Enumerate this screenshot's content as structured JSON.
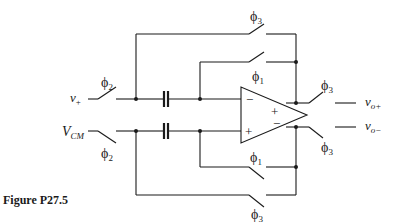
{
  "figure": {
    "caption": "Figure P27.5",
    "type": "switched-capacitor fully differential op-amp circuit"
  },
  "labels": {
    "input_plus": "v",
    "input_plus_sub": "+",
    "input_cm": "V",
    "input_cm_sub": "CM",
    "output_plus": "v",
    "output_plus_sub": "o+",
    "output_minus": "v",
    "output_minus_sub": "o−",
    "opamp_in_minus": "−",
    "opamp_in_plus": "+",
    "opamp_out_plus": "+",
    "opamp_out_minus": "−"
  },
  "switches": {
    "in_top": {
      "phase": "ϕ",
      "sub": "2"
    },
    "in_bottom": {
      "phase": "ϕ",
      "sub": "2"
    },
    "fb_outer_top": {
      "phase": "ϕ",
      "sub": "3"
    },
    "fb_inner_top": {
      "phase": "ϕ",
      "sub": "1"
    },
    "fb_inner_bottom": {
      "phase": "ϕ",
      "sub": "1"
    },
    "fb_outer_bottom": {
      "phase": "ϕ",
      "sub": "3"
    },
    "out_top": {
      "phase": "ϕ",
      "sub": "3"
    },
    "out_bottom": {
      "phase": "ϕ",
      "sub": "3"
    }
  }
}
